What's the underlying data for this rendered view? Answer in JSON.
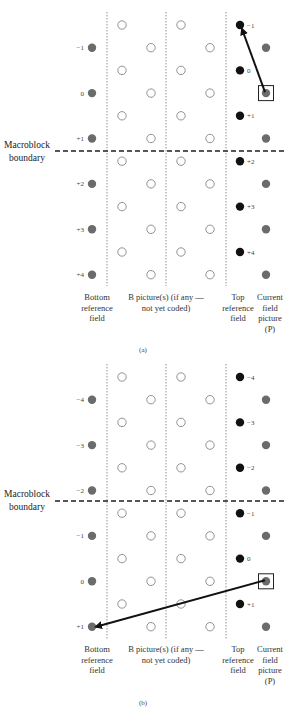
{
  "panels": [
    {
      "caption": "(a)",
      "boundary_label": [
        "Macroblock",
        "boundary"
      ],
      "bottom_field_labels": [
        "−1",
        "0",
        "+1",
        "+2",
        "+3",
        "+4"
      ],
      "top_field_labels": [
        "−1",
        "0",
        "+1",
        "+2",
        "+3",
        "+4"
      ],
      "column_labels": {
        "bottom": [
          "Bottom",
          "reference",
          "field"
        ],
        "b": [
          "B picture(s) (if any —",
          "not yet coded)"
        ],
        "top": [
          "Top",
          "reference",
          "field"
        ],
        "current": [
          "Current",
          "field",
          "picture",
          "(P)"
        ]
      },
      "motion_vector": {
        "from": "current field row 0",
        "to": "top reference field row −1"
      }
    },
    {
      "caption": "(b)",
      "boundary_label": [
        "Macroblock",
        "boundary"
      ],
      "bottom_field_labels": [
        "−4",
        "−3",
        "−2",
        "−1",
        "0",
        "+1"
      ],
      "top_field_labels": [
        "−4",
        "−3",
        "−2",
        "−1",
        "0",
        "+1"
      ],
      "column_labels": {
        "bottom": [
          "Bottom",
          "reference",
          "field"
        ],
        "b": [
          "B picture(s) (if any —",
          "not yet coded)"
        ],
        "top": [
          "Top",
          "reference",
          "field"
        ],
        "current": [
          "Current",
          "field",
          "picture",
          "(P)"
        ]
      },
      "motion_vector": {
        "from": "current field row 0",
        "to": "bottom reference field row +1"
      }
    }
  ],
  "colors": {
    "bottom_field_dot": "#6b6b6b",
    "top_field_dot": "#111111",
    "current_field_dot": "#6b6b6b",
    "b_picture_dot": "#ffffff",
    "arrow": "#111111"
  }
}
